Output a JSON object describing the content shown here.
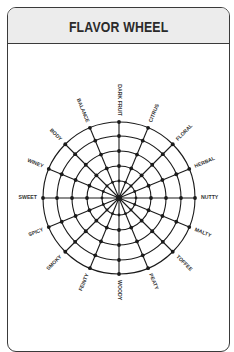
{
  "card": {
    "title": "FLAVOR WHEEL"
  },
  "wheel": {
    "center": [
      119,
      198
    ],
    "ring_radii": [
      17,
      32,
      47,
      62,
      76
    ],
    "line_color": "#1a1a1a",
    "spokes": [
      {
        "label": "DARK FRUIT"
      },
      {
        "label": "CITRUS"
      },
      {
        "label": "FLORAL"
      },
      {
        "label": "HERBAL"
      },
      {
        "label": "NUTTY"
      },
      {
        "label": "MALTY"
      },
      {
        "label": "TOFFEE"
      },
      {
        "label": "PEATY"
      },
      {
        "label": "WOODY"
      },
      {
        "label": "FEINTY"
      },
      {
        "label": "SMOKY"
      },
      {
        "label": "SPICY"
      },
      {
        "label": "SWEET"
      },
      {
        "label": "WINEY"
      },
      {
        "label": "BODY"
      },
      {
        "label": "BALANCE"
      }
    ]
  },
  "colors": {
    "header_bg": "#ececec",
    "border": "#3a3a3a",
    "text": "#2a2a2a"
  }
}
